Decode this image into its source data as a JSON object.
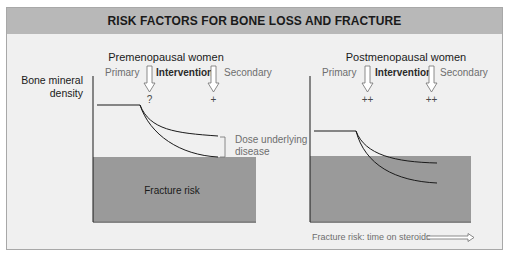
{
  "title": "RISK FACTORS FOR BONE LOSS AND FRACTURE",
  "y_axis_label": [
    "Bone mineral",
    "density"
  ],
  "colors": {
    "panel_bg": "#f0f0f0",
    "title_bar": "#b8b8b8",
    "fracture_zone": "#9a9a9a",
    "line": "#1a1a1a",
    "muted_text": "#6e6e6e",
    "arrow_fill": "#ffffff"
  },
  "panels": [
    {
      "heading": "Premenopausal women",
      "phase_labels": {
        "primary": "Primary",
        "intervention": "Intervention",
        "secondary": "Secondary"
      },
      "markers": [
        "?",
        "+"
      ],
      "bracket_label": [
        "Dose underlying",
        "disease"
      ],
      "fracture_label": "Fracture risk"
    },
    {
      "heading": "Postmenopausal women",
      "phase_labels": {
        "primary": "Primary",
        "intervention": "Intervention",
        "secondary": "Secondary"
      },
      "markers": [
        "++",
        "++"
      ]
    }
  ],
  "footer": {
    "x_axis_label": "Fracture risk: time on steroids"
  }
}
